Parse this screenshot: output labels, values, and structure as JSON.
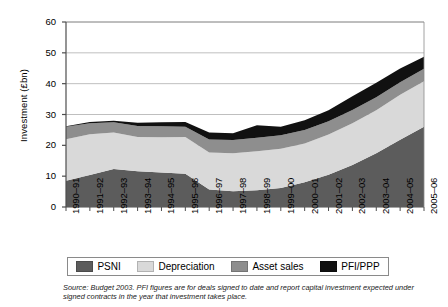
{
  "chart_data": {
    "type": "area",
    "stacked": true,
    "title": "",
    "xlabel": "",
    "ylabel": "Investment (£bn)",
    "ylim": [
      0,
      60
    ],
    "ytick_step": 10,
    "yticks": [
      "0",
      "10",
      "20",
      "30",
      "40",
      "50",
      "60"
    ],
    "grid": true,
    "grid_axis": "y",
    "legend_position": "bottom",
    "categories": [
      "1990–91",
      "1991–92",
      "1992–93",
      "1993–94",
      "1994–95",
      "1995–96",
      "1996–97",
      "1997–98",
      "1998–99",
      "1999–00",
      "2000–01",
      "2001–02",
      "2002–03",
      "2003–04",
      "2004–05",
      "2005–06"
    ],
    "series": [
      {
        "name": "PSNI",
        "color": "#5c5c5c",
        "values": [
          8.5,
          10.4,
          12.3,
          11.6,
          11.2,
          10.8,
          5.7,
          5.1,
          5.4,
          6.2,
          8.0,
          10.5,
          13.6,
          17.4,
          21.8,
          26.0
        ]
      },
      {
        "name": "Depreciation",
        "color": "#d9d9d9",
        "values": [
          13.5,
          13.2,
          11.9,
          11.1,
          11.4,
          11.9,
          12.0,
          12.3,
          12.7,
          12.7,
          12.6,
          13.0,
          13.6,
          14.0,
          14.6,
          14.8
        ]
      },
      {
        "name": "Asset sales",
        "color": "#8e8e8e",
        "values": [
          4.0,
          3.6,
          3.3,
          3.6,
          3.6,
          3.3,
          4.2,
          4.3,
          4.4,
          4.4,
          4.4,
          4.3,
          4.3,
          4.2,
          4.1,
          4.0
        ]
      },
      {
        "name": "PFI/PPP",
        "color": "#111111",
        "values": [
          0.2,
          0.4,
          0.5,
          1.0,
          1.3,
          1.6,
          2.3,
          2.2,
          4.0,
          2.7,
          3.1,
          3.6,
          4.4,
          4.7,
          4.4,
          3.9
        ]
      }
    ],
    "axis_color": "#4d4d4d",
    "grid_color": "#aeaeae"
  },
  "legend": {
    "items": [
      {
        "label": "PSNI",
        "color": "#5c5c5c"
      },
      {
        "label": "Depreciation",
        "color": "#d9d9d9"
      },
      {
        "label": "Asset sales",
        "color": "#8e8e8e"
      },
      {
        "label": "PFI/PPP",
        "color": "#111111"
      }
    ]
  },
  "source_note": "Source: Budget 2003. PFI figures are for deals signed to date and report capital investment expected under signed contracts in the year that investment takes place."
}
